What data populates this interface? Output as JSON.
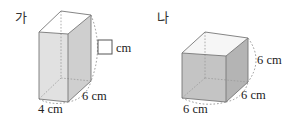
{
  "figures": [
    {
      "id": "ga",
      "label": "가",
      "label_pos": [
        15,
        22
      ],
      "shape": "rectangular-prism",
      "colors": {
        "front": "#e1e1e1",
        "side": "#cfcfcf",
        "top": "#ffffff"
      },
      "vertices": {
        "ftl": [
          39,
          32
        ],
        "ftr": [
          68,
          34
        ],
        "btl": [
          61,
          11
        ],
        "btr": [
          91,
          15
        ],
        "fbl": [
          39,
          99
        ],
        "fbr": [
          68,
          102
        ],
        "bbl": [
          61,
          78
        ],
        "bbr": [
          91,
          81
        ]
      },
      "dimensions": [
        {
          "name": "width",
          "text": "4 cm",
          "pos": [
            38,
            113
          ]
        },
        {
          "name": "depth",
          "text": "6 cm",
          "pos": [
            82,
            100
          ]
        },
        {
          "name": "height",
          "text": "cm",
          "pos": [
            116,
            52
          ],
          "blank_box": [
            98,
            40,
            14,
            14
          ]
        }
      ],
      "arcs": [
        "M 91 15 Q 104 48 91 81",
        "M 68 102 Q 86 99 91 81",
        "M 39 99 Q 52 106 68 102"
      ]
    },
    {
      "id": "na",
      "label": "나",
      "label_pos": [
        157,
        22
      ],
      "shape": "cube",
      "colors": {
        "front": "#c4c4c4",
        "side": "#b4b4b4",
        "top": "#f6f6f6"
      },
      "vertices": {
        "ftl": [
          182,
          53
        ],
        "ftr": [
          226,
          56
        ],
        "btl": [
          205,
          32
        ],
        "btr": [
          248,
          38
        ],
        "fbl": [
          182,
          98
        ],
        "fbr": [
          226,
          102
        ],
        "bbl": [
          205,
          78
        ],
        "bbr": [
          248,
          82
        ]
      },
      "dimensions": [
        {
          "name": "width",
          "text": "6 cm",
          "pos": [
            183,
            113
          ]
        },
        {
          "name": "depth",
          "text": "6 cm",
          "pos": [
            241,
            99
          ]
        },
        {
          "name": "height",
          "text": "6 cm",
          "pos": [
            257,
            64
          ]
        }
      ],
      "arcs": [
        "M 248 38 Q 264 60 248 82",
        "M 226 102 Q 244 98 248 82",
        "M 182 98 Q 203 108 226 102"
      ]
    }
  ]
}
